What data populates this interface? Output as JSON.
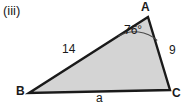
{
  "figure": {
    "part_label": "(iii)",
    "shape": "triangle",
    "fill_color": "#d4d4d4",
    "stroke_color": "#1a1a1a",
    "background_color": "#ffffff",
    "vertices": [
      {
        "name": "A",
        "label": "A",
        "x": 148,
        "y": 17
      },
      {
        "name": "B",
        "label": "B",
        "x": 29,
        "y": 93
      },
      {
        "name": "C",
        "label": "C",
        "x": 170,
        "y": 90
      }
    ],
    "sides": [
      {
        "name": "side-ab",
        "label": "14",
        "from": "A",
        "to": "B",
        "known": true
      },
      {
        "name": "side-ac",
        "label": "9",
        "from": "A",
        "to": "C",
        "known": true
      },
      {
        "name": "side-bc",
        "label": "a",
        "from": "B",
        "to": "C",
        "known": false
      }
    ],
    "angles": [
      {
        "name": "angle-a",
        "at": "A",
        "label": "76°",
        "value": 76,
        "unit": "degrees",
        "marked": true
      }
    ]
  }
}
